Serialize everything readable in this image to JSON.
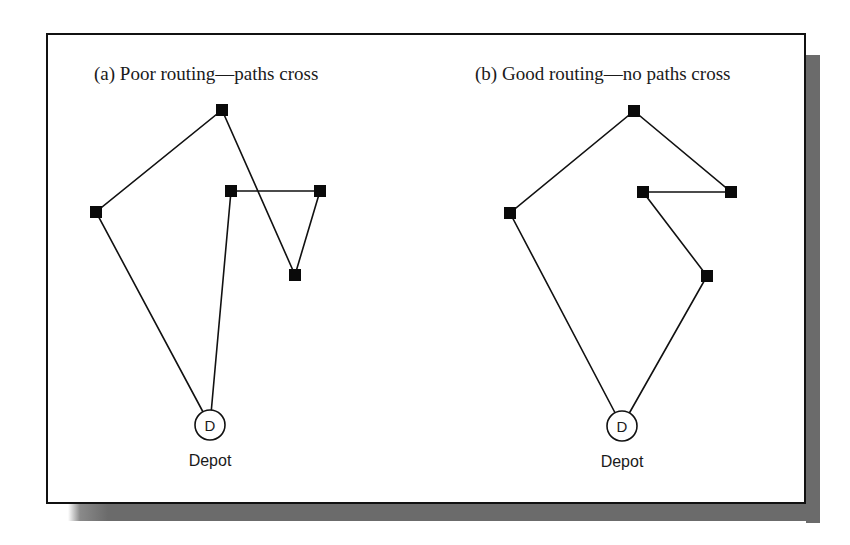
{
  "figure": {
    "panels": [
      {
        "id": "a",
        "title": "(a) Poor routing—paths cross",
        "depot": {
          "letter": "D",
          "label": "Depot",
          "x": 210,
          "y": 425
        },
        "stops": [
          {
            "name": "top",
            "x": 222,
            "y": 110
          },
          {
            "name": "left",
            "x": 96,
            "y": 212
          },
          {
            "name": "mid",
            "x": 231,
            "y": 191
          },
          {
            "name": "right",
            "x": 320,
            "y": 191
          },
          {
            "name": "low",
            "x": 295,
            "y": 275
          }
        ],
        "route": [
          "depot",
          "left",
          "top",
          "low",
          "right",
          "mid",
          "depot"
        ]
      },
      {
        "id": "b",
        "title": "(b) Good routing—no paths cross",
        "depot": {
          "letter": "D",
          "label": "Depot",
          "x": 622,
          "y": 426
        },
        "stops": [
          {
            "name": "top",
            "x": 634,
            "y": 111
          },
          {
            "name": "left",
            "x": 510,
            "y": 213
          },
          {
            "name": "mid",
            "x": 643,
            "y": 192
          },
          {
            "name": "right",
            "x": 731,
            "y": 192
          },
          {
            "name": "low",
            "x": 707,
            "y": 276
          }
        ],
        "route": [
          "depot",
          "left",
          "top",
          "right",
          "mid",
          "low",
          "depot"
        ]
      }
    ],
    "colors": {
      "line": "#111111",
      "node": "#0a0a0a",
      "shadow": "#6b6b6b",
      "frame": "#111111"
    }
  }
}
